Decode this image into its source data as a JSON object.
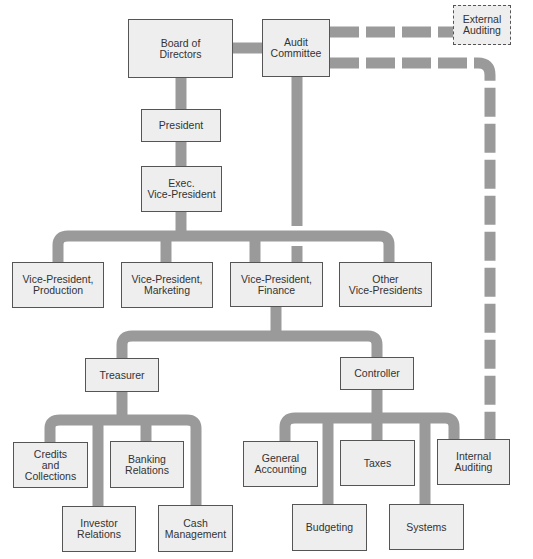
{
  "diagram": {
    "type": "organization-chart",
    "colors": {
      "connector": "#9a9a9a",
      "box_fill": "#eeeeee",
      "box_border": "#555555",
      "text": "#333333"
    },
    "nodes": {
      "board": "Board of\nDirectors",
      "audit_committee": "Audit\nCommittee",
      "external_auditing": "External\nAuditing",
      "president": "President",
      "exec_vp": "Exec.\nVice-President",
      "vp_production": "Vice-President,\nProduction",
      "vp_marketing": "Vice-President,\nMarketing",
      "vp_finance": "Vice-President,\nFinance",
      "other_vps": "Other\nVice-Presidents",
      "treasurer": "Treasurer",
      "controller": "Controller",
      "credits_collections": "Credits\nand\nCollections",
      "banking_relations": "Banking\nRelations",
      "investor_relations": "Investor\nRelations",
      "cash_management": "Cash\nManagement",
      "general_accounting": "General\nAccounting",
      "taxes": "Taxes",
      "internal_auditing": "Internal\nAuditing",
      "budgeting": "Budgeting",
      "systems": "Systems"
    },
    "edges": [
      {
        "from": "Board of Directors",
        "to": "Audit Committee",
        "style": "solid"
      },
      {
        "from": "Audit Committee",
        "to": "External Auditing",
        "style": "dashed"
      },
      {
        "from": "Audit Committee",
        "to": "Internal Auditing",
        "style": "dashed"
      },
      {
        "from": "Audit Committee",
        "to": "Vice-President, Finance",
        "style": "solid"
      },
      {
        "from": "Board of Directors",
        "to": "President",
        "style": "solid"
      },
      {
        "from": "President",
        "to": "Exec. Vice-President",
        "style": "solid"
      },
      {
        "from": "Exec. Vice-President",
        "to": "Vice-President, Production",
        "style": "solid"
      },
      {
        "from": "Exec. Vice-President",
        "to": "Vice-President, Marketing",
        "style": "solid"
      },
      {
        "from": "Exec. Vice-President",
        "to": "Vice-President, Finance",
        "style": "solid"
      },
      {
        "from": "Exec. Vice-President",
        "to": "Other Vice-Presidents",
        "style": "solid"
      },
      {
        "from": "Vice-President, Finance",
        "to": "Treasurer",
        "style": "solid"
      },
      {
        "from": "Vice-President, Finance",
        "to": "Controller",
        "style": "solid"
      },
      {
        "from": "Treasurer",
        "to": "Credits and Collections",
        "style": "solid"
      },
      {
        "from": "Treasurer",
        "to": "Investor Relations",
        "style": "solid"
      },
      {
        "from": "Treasurer",
        "to": "Banking Relations",
        "style": "solid"
      },
      {
        "from": "Treasurer",
        "to": "Cash Management",
        "style": "solid"
      },
      {
        "from": "Controller",
        "to": "General Accounting",
        "style": "solid"
      },
      {
        "from": "Controller",
        "to": "Budgeting",
        "style": "solid"
      },
      {
        "from": "Controller",
        "to": "Taxes",
        "style": "solid"
      },
      {
        "from": "Controller",
        "to": "Systems",
        "style": "solid"
      },
      {
        "from": "Controller",
        "to": "Internal Auditing",
        "style": "solid"
      }
    ]
  }
}
